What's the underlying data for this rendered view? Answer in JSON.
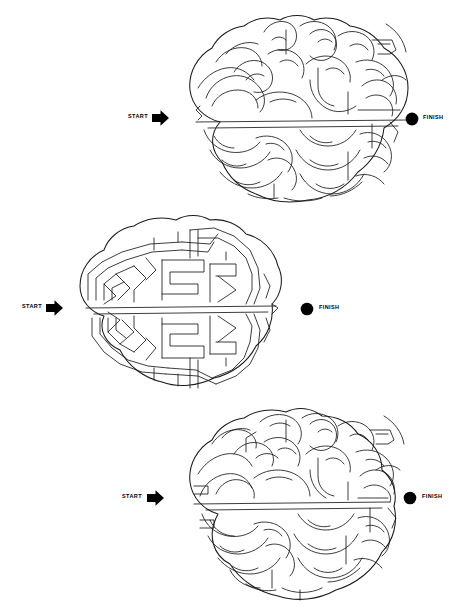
{
  "document": {
    "type": "maze-puzzle-worksheet",
    "background_color": "#ffffff",
    "ink_color": "#1a1a1a",
    "page_width": 474,
    "page_height": 612,
    "puzzle_count": 3
  },
  "mazes": [
    {
      "id": "maze-1",
      "shape": "brain-top-view",
      "style": "organic-gyri",
      "start_label": "START",
      "finish_label": "FINISH",
      "start_marker": "right-arrow",
      "finish_marker": "filled-circle",
      "start_x": 128,
      "start_y": 118,
      "finish_x": 412,
      "finish_y": 118,
      "bounds": {
        "x": 168,
        "y": 18,
        "width": 248,
        "height": 182
      }
    },
    {
      "id": "maze-2",
      "shape": "brain-top-view",
      "style": "rectilinear-spiral",
      "start_label": "START",
      "finish_label": "FINISH",
      "start_marker": "right-arrow",
      "finish_marker": "filled-circle",
      "start_x": 22,
      "start_y": 307,
      "finish_x": 303,
      "finish_y": 307,
      "bounds": {
        "x": 64,
        "y": 218,
        "width": 244,
        "height": 176
      }
    },
    {
      "id": "maze-3",
      "shape": "brain-top-view",
      "style": "organic-gyri",
      "start_label": "START",
      "finish_label": "FINISH",
      "start_marker": "right-arrow",
      "finish_marker": "filled-circle",
      "start_x": 122,
      "start_y": 497,
      "finish_x": 409,
      "finish_y": 497,
      "bounds": {
        "x": 168,
        "y": 414,
        "width": 250,
        "height": 184
      }
    }
  ],
  "labels": {
    "start": "START",
    "finish": "FINISH"
  }
}
